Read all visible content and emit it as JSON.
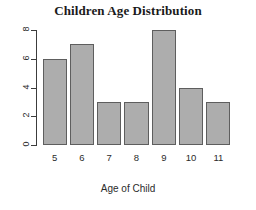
{
  "chart_data": {
    "type": "bar",
    "title": "Children Age Distribution",
    "xlabel": "Age of Child",
    "ylabel": "",
    "categories": [
      "5",
      "6",
      "7",
      "8",
      "9",
      "10",
      "11"
    ],
    "values": [
      6,
      7,
      3,
      3,
      8,
      4,
      3
    ],
    "ylim": [
      0,
      8
    ],
    "yticks": [
      "0",
      "2",
      "4",
      "6",
      "8"
    ],
    "ytick_values": [
      0,
      2,
      4,
      6,
      8
    ],
    "grid": false,
    "legend": false,
    "bar_fill_color": "#adadad",
    "bar_border_color": "#5e5e5e",
    "axis_color": "#3c3c3c",
    "background_color": "#ffffff",
    "text_color": "#2b2b2b",
    "ytick_label_rotation": 90
  }
}
